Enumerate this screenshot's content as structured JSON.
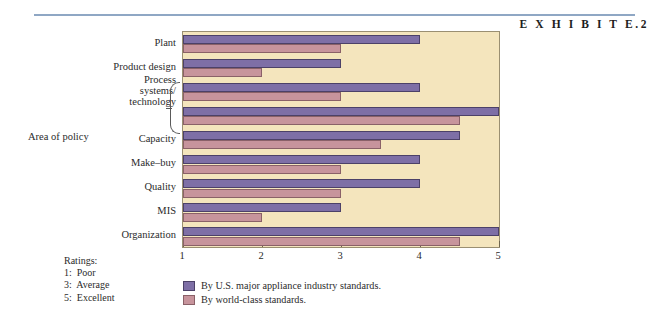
{
  "exhibit_label": "E X H I B I T  E.2",
  "axis_title": "Area of policy",
  "ratings": {
    "heading": "Ratings:",
    "items": [
      "1:  Poor",
      "3:  Average",
      "5:  Excellent"
    ]
  },
  "legend": {
    "us_label": "By U.S. major appliance industry standards.",
    "world_label": "By world-class standards."
  },
  "colors": {
    "us_bar": "#7e6fa6",
    "world_bar": "#c7949c",
    "plot_background": "#f4e5bd",
    "rule": "#8fa7c4",
    "frame": "#9a8f72"
  },
  "chart_data": {
    "type": "bar",
    "orientation": "horizontal",
    "title": "E X H I B I T  E.2",
    "xlabel": "",
    "ylabel": "Area of policy",
    "xlim": [
      1,
      5
    ],
    "xticks": [
      "1",
      "2",
      "3",
      "4",
      "5"
    ],
    "grid": false,
    "legend_position": "bottom",
    "categories": [
      "Plant",
      "Product design",
      "Process systems/technology",
      "",
      "Capacity",
      "Make–buy",
      "Quality",
      "MIS",
      "Organization"
    ],
    "series": [
      {
        "name": "By U.S. major appliance industry standards.",
        "color": "#7e6fa6",
        "values": [
          4.0,
          3.0,
          4.0,
          5.0,
          4.5,
          4.0,
          4.0,
          3.0,
          5.0
        ]
      },
      {
        "name": "By world-class standards.",
        "color": "#c7949c",
        "values": [
          3.0,
          2.0,
          3.0,
          4.5,
          3.5,
          3.0,
          3.0,
          2.0,
          4.5
        ]
      }
    ],
    "notes": {
      "rating_scale": [
        "1: Poor",
        "3: Average",
        "5: Excellent"
      ],
      "brace_groups": [
        2,
        3
      ]
    }
  }
}
